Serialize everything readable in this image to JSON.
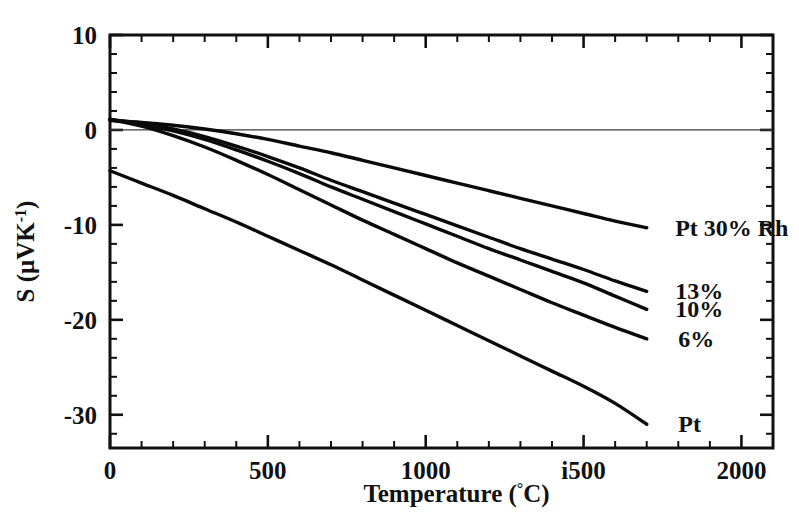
{
  "chart_data": {
    "type": "line",
    "title": "",
    "subtitle": "",
    "xlabel": "Temperature (°C)",
    "ylabel": "S  (μVK⁻¹)",
    "xlim": [
      0,
      2100
    ],
    "ylim": [
      -33.5,
      10
    ],
    "grid": false,
    "legend_position": "inline-right-of-curve-ends",
    "x_tick_labels": [
      "0",
      "500",
      "1000",
      "i500",
      "2000"
    ],
    "x_tick_values": [
      0,
      500,
      1000,
      1500,
      2000
    ],
    "x_minor_step": 100,
    "y_tick_labels": [
      "10",
      "0",
      "-10",
      "-20",
      "-30"
    ],
    "y_tick_values": [
      10,
      0,
      -10,
      -20,
      -30
    ],
    "y_minor_step": 2,
    "zero_reference_line": 0,
    "annotations": [
      {
        "text": "Pt 30% Rh",
        "x": 1790,
        "y": -10.3
      },
      {
        "text": "13%",
        "x": 1790,
        "y": -17.0
      },
      {
        "text": "10%",
        "x": 1790,
        "y": -18.9
      },
      {
        "text": "6%",
        "x": 1800,
        "y": -22.0
      },
      {
        "text": "Pt",
        "x": 1800,
        "y": -31.0
      }
    ],
    "series": [
      {
        "name": "Pt 30% Rh",
        "label": "Pt 30% Rh",
        "x": [
          0,
          100,
          200,
          300,
          400,
          500,
          600,
          700,
          800,
          900,
          1000,
          1100,
          1200,
          1300,
          1400,
          1500,
          1600,
          1700
        ],
        "values": [
          1.0,
          0.8,
          0.5,
          0.1,
          -0.4,
          -1.0,
          -1.7,
          -2.4,
          -3.2,
          -4.0,
          -4.8,
          -5.6,
          -6.4,
          -7.2,
          -8.0,
          -8.8,
          -9.6,
          -10.3
        ]
      },
      {
        "name": "13% Rh",
        "label": "13%",
        "x": [
          0,
          100,
          200,
          300,
          400,
          500,
          600,
          700,
          800,
          900,
          1000,
          1100,
          1200,
          1300,
          1400,
          1500,
          1600,
          1700
        ],
        "values": [
          1.1,
          0.7,
          0.1,
          -0.7,
          -1.7,
          -2.8,
          -4.0,
          -5.3,
          -6.5,
          -7.7,
          -8.9,
          -10.1,
          -11.3,
          -12.5,
          -13.6,
          -14.7,
          -15.9,
          -17.0
        ]
      },
      {
        "name": "10% Rh",
        "label": "10%",
        "x": [
          0,
          100,
          200,
          300,
          400,
          500,
          600,
          700,
          800,
          900,
          1000,
          1100,
          1200,
          1300,
          1400,
          1500,
          1600,
          1700
        ],
        "values": [
          1.1,
          0.6,
          -0.1,
          -1.0,
          -2.1,
          -3.3,
          -4.6,
          -6.0,
          -7.3,
          -8.6,
          -9.9,
          -11.2,
          -12.5,
          -13.7,
          -14.9,
          -16.1,
          -17.5,
          -18.9
        ]
      },
      {
        "name": "6% Rh",
        "label": "6%",
        "x": [
          0,
          100,
          200,
          300,
          400,
          500,
          600,
          700,
          800,
          900,
          1000,
          1100,
          1200,
          1300,
          1400,
          1500,
          1600,
          1700
        ],
        "values": [
          1.1,
          0.4,
          -0.6,
          -1.8,
          -3.2,
          -4.7,
          -6.3,
          -7.9,
          -9.5,
          -11.0,
          -12.5,
          -14.0,
          -15.4,
          -16.8,
          -18.2,
          -19.5,
          -20.8,
          -22.0
        ]
      },
      {
        "name": "Pt",
        "label": "Pt",
        "x": [
          0,
          100,
          200,
          300,
          400,
          500,
          600,
          700,
          800,
          900,
          1000,
          1100,
          1200,
          1300,
          1400,
          1500,
          1600,
          1700
        ],
        "values": [
          -4.3,
          -5.6,
          -6.9,
          -8.3,
          -9.7,
          -11.2,
          -12.7,
          -14.2,
          -15.8,
          -17.4,
          -19.0,
          -20.6,
          -22.2,
          -23.8,
          -25.4,
          -27.0,
          -28.8,
          -31.0
        ]
      }
    ]
  }
}
